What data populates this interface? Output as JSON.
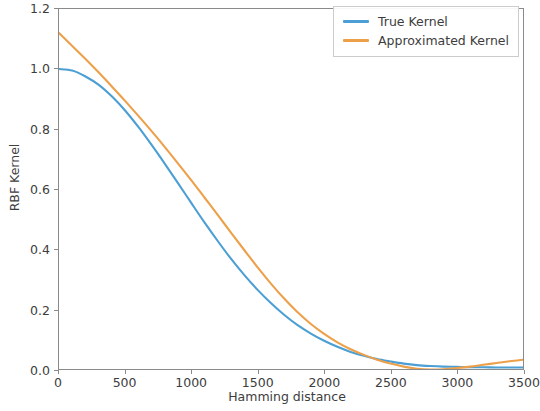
{
  "chart_data": {
    "type": "line",
    "title": "",
    "xlabel": "Hamming distance",
    "ylabel": "RBF Kernel",
    "xlim": [
      0,
      3500
    ],
    "ylim": [
      0.0,
      1.2
    ],
    "xticks": [
      0,
      500,
      1000,
      1500,
      2000,
      2500,
      3000,
      3500
    ],
    "xtick_labels": [
      "0",
      "500",
      "1000",
      "1500",
      "2000",
      "2500",
      "3000",
      "3500"
    ],
    "yticks": [
      0.0,
      0.2,
      0.4,
      0.6,
      0.8,
      1.0,
      1.2
    ],
    "ytick_labels": [
      "0.0",
      "0.2",
      "0.4",
      "0.6",
      "0.8",
      "1.0",
      "1.2"
    ],
    "grid": false,
    "legend_position": "upper right",
    "colors": {
      "true_kernel": "#4c9fd4",
      "approximated_kernel": "#eda04a"
    },
    "x": [
      0,
      100,
      200,
      300,
      400,
      500,
      600,
      700,
      800,
      900,
      1000,
      1100,
      1200,
      1300,
      1400,
      1500,
      1600,
      1700,
      1800,
      1900,
      2000,
      2100,
      2200,
      2300,
      2400,
      2500,
      2600,
      2700,
      2800,
      2900,
      3000,
      3100,
      3200,
      3300,
      3400,
      3500
    ],
    "series": [
      {
        "name": "True Kernel",
        "color": "#4c9fd4",
        "values": [
          1.0,
          0.995,
          0.975,
          0.947,
          0.908,
          0.861,
          0.806,
          0.746,
          0.683,
          0.618,
          0.552,
          0.487,
          0.425,
          0.366,
          0.312,
          0.263,
          0.219,
          0.18,
          0.146,
          0.118,
          0.094,
          0.074,
          0.057,
          0.044,
          0.033,
          0.025,
          0.018,
          0.013,
          0.01,
          0.008,
          0.007,
          0.006,
          0.006,
          0.005,
          0.005,
          0.005
        ]
      },
      {
        "name": "Approximated Kernel",
        "color": "#eda04a",
        "values": [
          1.12,
          1.077,
          1.033,
          0.988,
          0.941,
          0.893,
          0.843,
          0.792,
          0.739,
          0.684,
          0.628,
          0.57,
          0.512,
          0.453,
          0.395,
          0.338,
          0.284,
          0.234,
          0.189,
          0.15,
          0.117,
          0.089,
          0.066,
          0.047,
          0.031,
          0.018,
          0.008,
          0.001,
          -0.002,
          -0.001,
          0.003,
          0.008,
          0.014,
          0.02,
          0.026,
          0.031
        ]
      }
    ]
  },
  "legend": {
    "entries": [
      {
        "label": "True Kernel"
      },
      {
        "label": "Approximated Kernel"
      }
    ]
  }
}
